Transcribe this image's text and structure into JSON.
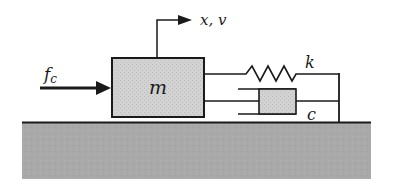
{
  "diagram": {
    "mass": {
      "label": "m",
      "fill": "#d0d0d0"
    },
    "force": {
      "label": "f",
      "subscript": "c"
    },
    "motion": {
      "label": "x, v"
    },
    "spring": {
      "label": "k"
    },
    "damper": {
      "label": "c",
      "fill": "#d0d0d0"
    },
    "ground": {
      "fill": "#a9a9a9"
    },
    "stroke_color": "#1a1a1a"
  }
}
